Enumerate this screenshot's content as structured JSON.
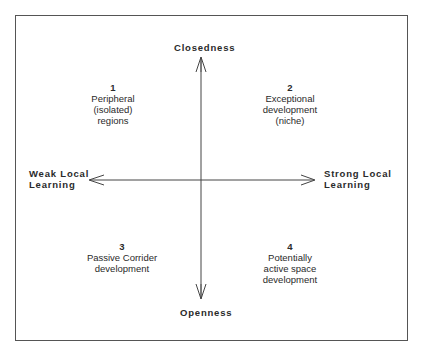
{
  "axes": {
    "top": "Closedness",
    "bottom": "Openness",
    "left": [
      "Weak Local",
      "Learning"
    ],
    "right": [
      "Strong Local",
      "Learning"
    ]
  },
  "quadrants": [
    {
      "num": "1",
      "lines": [
        "Peripheral",
        "(isolated)",
        "regions"
      ]
    },
    {
      "num": "2",
      "lines": [
        "Exceptional",
        "development",
        "(niche)"
      ]
    },
    {
      "num": "3",
      "lines": [
        "Passive Corrider",
        "development"
      ]
    },
    {
      "num": "4",
      "lines": [
        "Potentially",
        "active space",
        "development"
      ]
    }
  ],
  "colors": {
    "line": "#444444",
    "text": "#2a2a2a",
    "background": "#ffffff"
  }
}
